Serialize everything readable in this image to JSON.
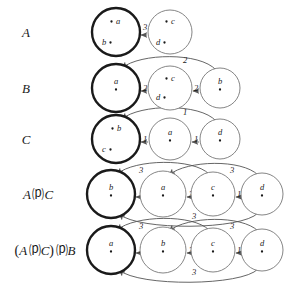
{
  "figure": {
    "type": "automata-transition-diagram",
    "background": "#ffffff",
    "ink": "#1a1a1a",
    "line": "#555555",
    "accepting_stroke_width": 2.4,
    "normal_stroke_width": 0.9
  },
  "rows": [
    {
      "id": "row-a",
      "label": "A",
      "label_parts": [
        {
          "text": "A",
          "style": "italic"
        }
      ],
      "nodes": [
        {
          "id": "a-n1",
          "name": "n1",
          "cx": 116,
          "cy": 32,
          "r": 24,
          "bold": true,
          "items": [
            {
              "text": "a",
              "dot": "left",
              "x": 118,
              "y": 24
            },
            {
              "text": "b",
              "dot": "right",
              "x": 104,
              "y": 45
            }
          ]
        },
        {
          "id": "a-n2",
          "name": "n2",
          "cx": 170,
          "cy": 32,
          "r": 22,
          "bold": false,
          "items": [
            {
              "text": "c",
              "dot": "left",
              "x": 173,
              "y": 24
            },
            {
              "text": "d",
              "dot": "right",
              "x": 158,
              "y": 45
            }
          ]
        }
      ],
      "edges": [
        {
          "from": "a-n2",
          "to": "a-n1",
          "weight": "3",
          "kind": "straight",
          "lx": 145,
          "ly": 30
        }
      ]
    },
    {
      "id": "row-b",
      "label": "B",
      "label_parts": [
        {
          "text": "B",
          "style": "italic"
        }
      ],
      "nodes": [
        {
          "id": "b-n1",
          "name": "n1",
          "cx": 116,
          "cy": 88,
          "r": 24,
          "bold": true,
          "items": [
            {
              "text": "a",
              "dot": "below",
              "x": 116,
              "y": 84
            }
          ]
        },
        {
          "id": "b-n2",
          "name": "n2",
          "cx": 170,
          "cy": 88,
          "r": 22,
          "bold": false,
          "items": [
            {
              "text": "c",
              "dot": "left",
              "x": 173,
              "y": 81
            },
            {
              "text": "d",
              "dot": "right",
              "x": 158,
              "y": 100
            }
          ]
        },
        {
          "id": "b-n3",
          "name": "n3",
          "cx": 220,
          "cy": 88,
          "r": 20,
          "bold": false,
          "items": [
            {
              "text": "b",
              "dot": "below",
              "x": 220,
              "y": 84
            }
          ]
        }
      ],
      "edges": [
        {
          "from": "b-n2",
          "to": "b-n1",
          "weight": "2",
          "kind": "straight",
          "lx": 145,
          "ly": 91
        },
        {
          "from": "b-n3",
          "to": "b-n2",
          "weight": "2",
          "kind": "straight",
          "lx": 196,
          "ly": 91
        },
        {
          "from": "b-n3",
          "to": "b-n1",
          "weight": "2",
          "kind": "arc-top",
          "lx": 185,
          "ly": 63
        }
      ]
    },
    {
      "id": "row-c",
      "label": "C",
      "label_parts": [
        {
          "text": "C",
          "style": "italic"
        }
      ],
      "nodes": [
        {
          "id": "c-n1",
          "name": "n1",
          "cx": 116,
          "cy": 139,
          "r": 24,
          "bold": true,
          "items": [
            {
              "text": "b",
              "dot": "left",
              "x": 119,
              "y": 131
            },
            {
              "text": "c",
              "dot": "right",
              "x": 104,
              "y": 152
            }
          ]
        },
        {
          "id": "c-n2",
          "name": "n2",
          "cx": 170,
          "cy": 139,
          "r": 21,
          "bold": false,
          "items": [
            {
              "text": "a",
              "dot": "below",
              "x": 170,
              "y": 135
            }
          ]
        },
        {
          "id": "c-n3",
          "name": "n3",
          "cx": 220,
          "cy": 139,
          "r": 20,
          "bold": false,
          "items": [
            {
              "text": "d",
              "dot": "below",
              "x": 220,
              "y": 135
            }
          ]
        }
      ],
      "edges": [
        {
          "from": "c-n2",
          "to": "c-n1",
          "weight": "1",
          "kind": "straight",
          "lx": 145,
          "ly": 142
        },
        {
          "from": "c-n3",
          "to": "c-n2",
          "weight": "1",
          "kind": "straight",
          "lx": 196,
          "ly": 142
        },
        {
          "from": "c-n3",
          "to": "c-n1",
          "weight": "1",
          "kind": "arc-top",
          "lx": 185,
          "ly": 115
        }
      ]
    },
    {
      "id": "row-ac",
      "label": "A ⒫ C",
      "label_parts": [
        {
          "text": "A",
          "style": "italic"
        },
        {
          "text": "⒫",
          "style": "op"
        },
        {
          "text": "C",
          "style": "italic"
        }
      ],
      "nodes": [
        {
          "id": "ac-n1",
          "name": "n1",
          "cx": 111,
          "cy": 194,
          "r": 24,
          "bold": true,
          "items": [
            {
              "text": "b",
              "dot": "below",
              "x": 111,
              "y": 190
            }
          ]
        },
        {
          "id": "ac-n2",
          "name": "n2",
          "cx": 163,
          "cy": 194,
          "r": 23,
          "bold": false,
          "items": [
            {
              "text": "a",
              "dot": "below",
              "x": 163,
              "y": 190
            }
          ]
        },
        {
          "id": "ac-n3",
          "name": "n3",
          "cx": 213,
          "cy": 194,
          "r": 22,
          "bold": false,
          "items": [
            {
              "text": "c",
              "dot": "below",
              "x": 213,
              "y": 190
            }
          ]
        },
        {
          "id": "ac-n4",
          "name": "n4",
          "cx": 262,
          "cy": 194,
          "r": 21,
          "bold": false,
          "items": [
            {
              "text": "d",
              "dot": "below",
              "x": 262,
              "y": 190
            }
          ]
        }
      ],
      "edges": [
        {
          "from": "ac-n2",
          "to": "ac-n1",
          "weight": "1",
          "kind": "straight",
          "lx": 141,
          "ly": 197
        },
        {
          "from": "ac-n3",
          "to": "ac-n2",
          "weight": "3",
          "kind": "straight",
          "lx": 191,
          "ly": 197
        },
        {
          "from": "ac-n4",
          "to": "ac-n3",
          "weight": "1",
          "kind": "straight",
          "lx": 239,
          "ly": 197
        },
        {
          "from": "ac-n3",
          "to": "ac-n1",
          "weight": "3",
          "kind": "arc-top",
          "lx": 141,
          "ly": 173
        },
        {
          "from": "ac-n4",
          "to": "ac-n2",
          "weight": "3",
          "kind": "arc-top",
          "lx": 232,
          "ly": 173
        },
        {
          "from": "ac-n4",
          "to": "ac-n1",
          "weight": "3",
          "kind": "arc-bottom",
          "lx": 194,
          "ly": 219
        }
      ]
    },
    {
      "id": "row-acb",
      "label": "(A ⒫ C) ⒫ B",
      "label_parts": [
        {
          "text": "(",
          "style": "paren"
        },
        {
          "text": "A",
          "style": "italic"
        },
        {
          "text": "⒫",
          "style": "op"
        },
        {
          "text": "C",
          "style": "italic"
        },
        {
          "text": ")",
          "style": "paren"
        },
        {
          "text": "⒫",
          "style": "op"
        },
        {
          "text": "B",
          "style": "italic"
        }
      ],
      "nodes": [
        {
          "id": "x-n1",
          "name": "n1",
          "cx": 111,
          "cy": 250,
          "r": 24,
          "bold": true,
          "items": [
            {
              "text": "a",
              "dot": "below",
              "x": 111,
              "y": 246
            }
          ]
        },
        {
          "id": "x-n2",
          "name": "n2",
          "cx": 163,
          "cy": 250,
          "r": 23,
          "bold": false,
          "items": [
            {
              "text": "b",
              "dot": "below",
              "x": 163,
              "y": 246
            }
          ]
        },
        {
          "id": "x-n3",
          "name": "n3",
          "cx": 213,
          "cy": 250,
          "r": 22,
          "bold": false,
          "items": [
            {
              "text": "c",
              "dot": "below",
              "x": 213,
              "y": 246
            }
          ]
        },
        {
          "id": "x-n4",
          "name": "n4",
          "cx": 262,
          "cy": 250,
          "r": 21,
          "bold": false,
          "items": [
            {
              "text": "d",
              "dot": "below",
              "x": 262,
              "y": 246
            }
          ]
        }
      ],
      "edges": [
        {
          "from": "x-n2",
          "to": "x-n1",
          "weight": "2",
          "kind": "straight",
          "lx": 141,
          "ly": 253
        },
        {
          "from": "x-n3",
          "to": "x-n2",
          "weight": "3",
          "kind": "straight",
          "lx": 191,
          "ly": 253
        },
        {
          "from": "x-n4",
          "to": "x-n3",
          "weight": "1",
          "kind": "straight",
          "lx": 239,
          "ly": 253
        },
        {
          "from": "x-n3",
          "to": "x-n1",
          "weight": "3",
          "kind": "arc-top",
          "lx": 141,
          "ly": 229
        },
        {
          "from": "x-n4",
          "to": "x-n2",
          "weight": "3",
          "kind": "arc-top",
          "lx": 232,
          "ly": 229
        },
        {
          "from": "x-n4",
          "to": "x-n1",
          "weight": "3",
          "kind": "arc-bottom",
          "lx": 194,
          "ly": 275
        }
      ]
    }
  ],
  "row_label_positions": [
    {
      "x": 26,
      "y": 37,
      "anchor": "middle"
    },
    {
      "x": 26,
      "y": 93,
      "anchor": "middle"
    },
    {
      "x": 26,
      "y": 144,
      "anchor": "middle"
    },
    {
      "x": 38,
      "y": 199,
      "anchor": "middle"
    },
    {
      "x": 45,
      "y": 255,
      "anchor": "middle"
    }
  ]
}
